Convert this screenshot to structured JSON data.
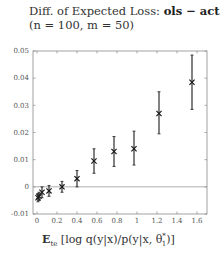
{
  "title": {
    "line1_prefix": "Diff. of Expected Loss: ",
    "line1_bold": "ols − act",
    "line2": "(n = 100, m = 50)"
  },
  "xlabel": {
    "bold": "E",
    "subscript": "te",
    "rest": " [log q(y|x)/p(y|x, θ",
    "sup": "*",
    "sub2": "1",
    "close": ")]"
  },
  "chart_data": {
    "type": "scatter",
    "title": "Diff. of Expected Loss: ols − act (n = 100, m = 50)",
    "xlabel": "E_te[log q(y|x)/p(y|x, θ*_1)]",
    "ylabel": "",
    "xlim": [
      -0.04,
      1.7
    ],
    "ylim": [
      -0.01,
      0.05
    ],
    "xticks": [
      0,
      0.2,
      0.4,
      0.6,
      0.8,
      1,
      1.2,
      1.4,
      1.6
    ],
    "xtick_labels": [
      "0",
      "0.2",
      "0.4",
      "0.6",
      "0.8",
      "1",
      "1.2",
      "1.4",
      "1.6"
    ],
    "yticks": [
      -0.01,
      0,
      0.01,
      0.02,
      0.03,
      0.04,
      0.05
    ],
    "ytick_labels": [
      "-0.01",
      "0",
      "0.01",
      "0.02",
      "0.03",
      "0.04",
      "0.05"
    ],
    "grid": false,
    "reference_line_y": 0,
    "marker": "x",
    "series": [
      {
        "name": "ols − act",
        "points": [
          {
            "x": 0.01,
            "y": -0.004,
            "err_low": -0.0055,
            "err_high": -0.0025
          },
          {
            "x": 0.02,
            "y": -0.0035,
            "err_low": -0.005,
            "err_high": -0.002
          },
          {
            "x": 0.05,
            "y": -0.002,
            "err_low": -0.004,
            "err_high": 0.0
          },
          {
            "x": 0.12,
            "y": -0.0015,
            "err_low": -0.0035,
            "err_high": 0.0005
          },
          {
            "x": 0.25,
            "y": 0.0,
            "err_low": -0.002,
            "err_high": 0.002
          },
          {
            "x": 0.4,
            "y": 0.003,
            "err_low": 0.0,
            "err_high": 0.006
          },
          {
            "x": 0.57,
            "y": 0.0095,
            "err_low": 0.005,
            "err_high": 0.014
          },
          {
            "x": 0.77,
            "y": 0.013,
            "err_low": 0.0075,
            "err_high": 0.0185
          },
          {
            "x": 0.97,
            "y": 0.014,
            "err_low": 0.008,
            "err_high": 0.0205
          },
          {
            "x": 1.22,
            "y": 0.027,
            "err_low": 0.0195,
            "err_high": 0.035
          },
          {
            "x": 1.55,
            "y": 0.0385,
            "err_low": 0.0285,
            "err_high": 0.0485
          }
        ]
      }
    ]
  },
  "colors": {
    "axis": "#8a8a8a",
    "zero_line": "#9a9a9a",
    "marker": "#1a1a1a"
  }
}
